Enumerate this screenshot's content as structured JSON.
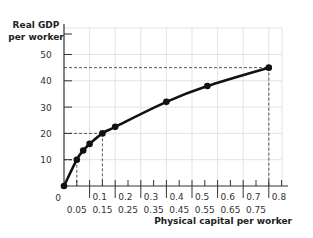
{
  "chart_data": {
    "type": "line",
    "title": "",
    "xlabel": "Physical capital per worker",
    "ylabel": "Real GDP per worker",
    "ylabel_lines": [
      "Real GDP",
      "per worker"
    ],
    "xlim": [
      0,
      0.85
    ],
    "ylim": [
      0,
      55
    ],
    "grid": true,
    "legend": "none",
    "y_ticks": [
      0,
      10,
      20,
      30,
      40,
      50
    ],
    "y_tick_labels": [
      "0",
      "10",
      "20",
      "30",
      "40",
      "50"
    ],
    "x_ticks_upper": [
      0.1,
      0.2,
      0.3,
      0.4,
      0.5,
      0.6,
      0.7,
      0.8
    ],
    "x_tick_labels_upper": [
      "0.1",
      "0.2",
      "0.3",
      "0.4",
      "0.5",
      "0.6",
      "0.7",
      "0.8"
    ],
    "x_ticks_lower": [
      0.05,
      0.15,
      0.25,
      0.35,
      0.45,
      0.55,
      0.65,
      0.75
    ],
    "x_tick_labels_lower": [
      "0.05",
      "0.15",
      "0.25",
      "0.35",
      "0.45",
      "0.55",
      "0.65",
      "0.75"
    ],
    "series": [
      {
        "name": "Productivity curve",
        "x": [
          0,
          0.05,
          0.075,
          0.1,
          0.15,
          0.2,
          0.4,
          0.56,
          0.8
        ],
        "y": [
          0,
          10,
          13.5,
          16,
          20,
          22.5,
          32,
          38,
          45
        ]
      }
    ],
    "annotations": [
      {
        "type": "dashed-guide",
        "x": 0.05,
        "y": 10
      },
      {
        "type": "dashed-guide",
        "x": 0.15,
        "y": 20
      },
      {
        "type": "dashed-guide",
        "x": 0.8,
        "y": 45
      }
    ]
  }
}
